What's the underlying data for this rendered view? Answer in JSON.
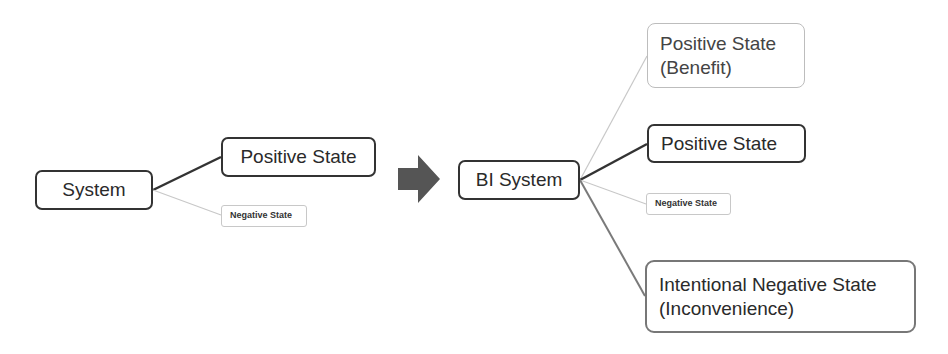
{
  "diagram": {
    "before": {
      "root": "System",
      "positive": "Positive State",
      "negative": "Negative State"
    },
    "transition_icon": "right-arrow-icon",
    "after": {
      "root": "BI System",
      "benefit": "Positive State\n(Benefit)",
      "positive": "Positive State",
      "negative": "Negative State",
      "intentional_negative": "Intentional Negative State\n(Inconvenience)"
    },
    "colors": {
      "strong_edge": "#333333",
      "weak_edge": "#c8c8c8",
      "mid_edge": "#7a7a7a",
      "arrow": "#555555"
    }
  }
}
